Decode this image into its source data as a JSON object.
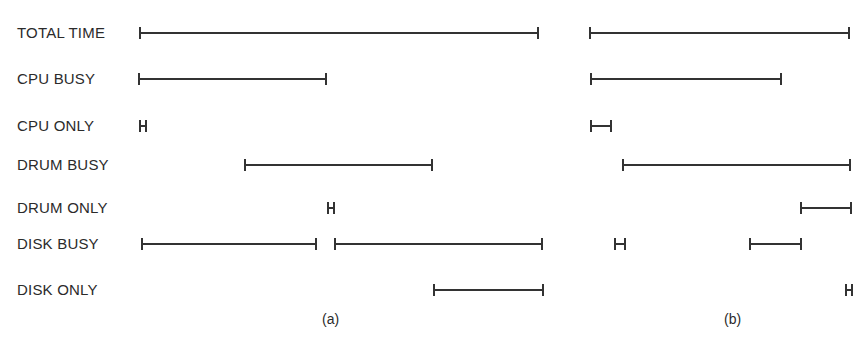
{
  "rows": [
    {
      "label": "TOTAL TIME",
      "y": 33
    },
    {
      "label": "CPU BUSY",
      "y": 79
    },
    {
      "label": "CPU ONLY",
      "y": 126
    },
    {
      "label": "DRUM BUSY",
      "y": 165
    },
    {
      "label": "DRUM ONLY",
      "y": 208
    },
    {
      "label": "DISK BUSY",
      "y": 244
    },
    {
      "label": "DISK ONLY",
      "y": 290
    }
  ],
  "panels": [
    {
      "caption": "(a)",
      "caption_x": 322,
      "bars": [
        {
          "row": 0,
          "x1": 140,
          "x2": 538
        },
        {
          "row": 1,
          "x1": 139,
          "x2": 326
        },
        {
          "row": 2,
          "x1": 140,
          "x2": 146
        },
        {
          "row": 3,
          "x1": 245,
          "x2": 432
        },
        {
          "row": 4,
          "x1": 328,
          "x2": 334
        },
        {
          "row": 5,
          "x1": 142,
          "x2": 316
        },
        {
          "row": 5,
          "x1": 335,
          "x2": 542
        },
        {
          "row": 6,
          "x1": 434,
          "x2": 543
        }
      ]
    },
    {
      "caption": "(b)",
      "caption_x": 724,
      "bars": [
        {
          "row": 0,
          "x1": 590,
          "x2": 849
        },
        {
          "row": 1,
          "x1": 591,
          "x2": 781
        },
        {
          "row": 2,
          "x1": 591,
          "x2": 611
        },
        {
          "row": 3,
          "x1": 623,
          "x2": 850
        },
        {
          "row": 4,
          "x1": 801,
          "x2": 851
        },
        {
          "row": 5,
          "x1": 615,
          "x2": 625
        },
        {
          "row": 5,
          "x1": 750,
          "x2": 801
        },
        {
          "row": 6,
          "x1": 846,
          "x2": 852
        }
      ]
    }
  ],
  "caption_y": 311
}
